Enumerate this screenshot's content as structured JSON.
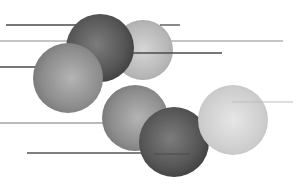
{
  "illustration": {
    "subject": "abstract spheres with horizontal lines",
    "palette": {
      "background": "#ffffff",
      "dark_sphere": "#5a5a5a",
      "mid_sphere": "#8a8a8a",
      "light_sphere": "#cfcfcf",
      "line_dark": "#4a4a4a",
      "line_mid": "#8c8c8c",
      "line_light": "#bdbdbd"
    }
  }
}
